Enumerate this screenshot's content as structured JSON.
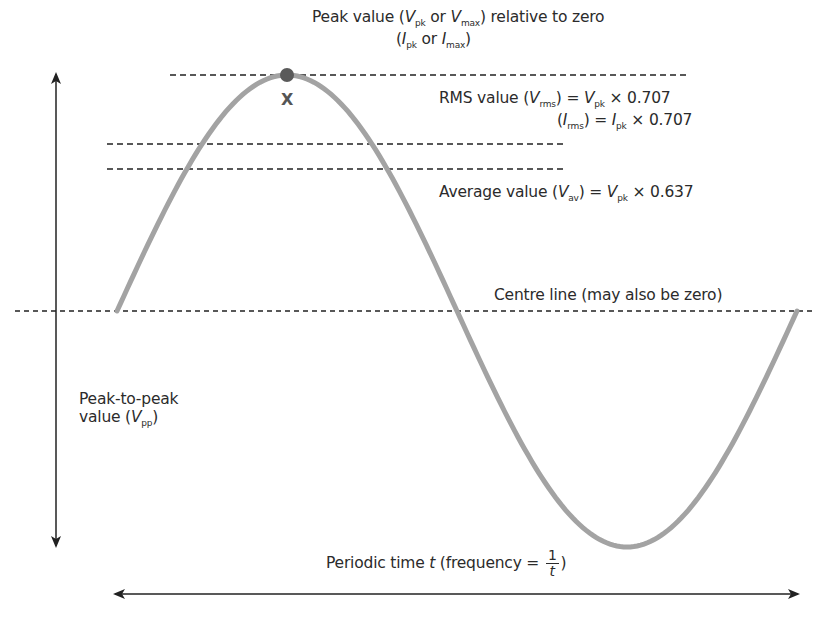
{
  "diagram": {
    "type": "sine-wave-ac-values",
    "colors": {
      "wave": "#a3a3a3",
      "peak_marker": "#5a5a5a",
      "lines": "#222222",
      "text": "#2b2b2b"
    },
    "labels": {
      "peak": {
        "line1_pre": "Peak value (",
        "v": "V",
        "v_sub_pk": "pk",
        "or1": " or ",
        "v_sub_max": "max",
        "line1_post": ") relative to zero",
        "line2_pre": "(",
        "i": "I",
        "i_sub_pk": "pk",
        "or2": " or ",
        "i_sub_max": "max",
        "line2_post": ")"
      },
      "peak_marker": "X",
      "rms": {
        "line1_pre": "RMS value (",
        "v": "V",
        "sub_rms": "rms",
        "eq": ") = ",
        "sub_pk": "pk",
        "factor": " × 0.707",
        "line2_pre": "(",
        "i": "I"
      },
      "average": {
        "pre": "Average value (",
        "v": "V",
        "sub_av": "av",
        "eq": ") = ",
        "sub_pk": "pk",
        "factor": " × 0.637"
      },
      "centre_line": "Centre line (may also be zero)",
      "peak_to_peak": {
        "line1": "Peak-to-peak",
        "line2_pre": "value (",
        "v": "V",
        "sub_pp": "pp",
        "line2_post": ")"
      },
      "periodic_time": {
        "pre": "Periodic time ",
        "t": "t",
        "mid": " (frequency = ",
        "numerator": "1",
        "denominator": "t",
        "post": ")"
      }
    },
    "values": {
      "rms_factor": 0.707,
      "average_factor": 0.637
    }
  }
}
